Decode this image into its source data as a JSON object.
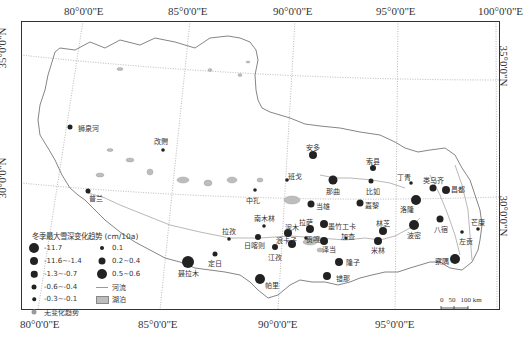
{
  "map": {
    "longitude_ticks_top": [
      "80°0'0\"E",
      "85°0'0\"E",
      "90°0'0\"E",
      "95°0'0\"E",
      "100°0'0\"E"
    ],
    "longitude_ticks_bottom": [
      "80°0'0\"E",
      "85°0'0\"E",
      "90°0'0\"E",
      "95°0'0\"E"
    ],
    "latitude_ticks_left": [
      "35°0'0\"N",
      "30°0'0\"N"
    ],
    "latitude_ticks_right": [
      "35°0'0\"N",
      "30°0'0\"N"
    ],
    "colors": {
      "frame": "#333333",
      "boundary": "#777777",
      "graticule": "#999999",
      "station": "#222222",
      "no_change": "#9a9a9a",
      "lake": "#bdbdbd",
      "river": "#9a9a9a"
    }
  },
  "legend": {
    "title": "冬季最大雪深变化趋势 (cm/10a)",
    "items": [
      {
        "label": "-11.7",
        "size": 10,
        "color": "#222222"
      },
      {
        "label": "-11.6~-1.4",
        "size": 8,
        "color": "#222222"
      },
      {
        "label": "-1.3~-0.7",
        "size": 6.5,
        "color": "#222222"
      },
      {
        "label": "-0.6~-0.4",
        "size": 5,
        "color": "#222222"
      },
      {
        "label": "-0.3~-0.1",
        "size": 3.5,
        "color": "#222222"
      },
      {
        "label": "无变化趋势",
        "size": 5,
        "color": "#9a9a9a"
      },
      {
        "label": "0.1",
        "size": 4,
        "color": "#222222"
      },
      {
        "label": "0.2~0.4",
        "size": 7,
        "color": "#222222"
      },
      {
        "label": "0.5~0.6",
        "size": 10,
        "color": "#222222"
      },
      {
        "label": "河流",
        "type": "line"
      },
      {
        "label": "湖泊",
        "type": "rect"
      }
    ]
  },
  "scale_bar": {
    "labels": [
      "0",
      "50",
      "100 km"
    ]
  },
  "stations": [
    {
      "name": "狮泉河",
      "x": 70,
      "y": 127,
      "r": 2.5,
      "lx": 88,
      "ly": 123
    },
    {
      "name": "普兰",
      "x": 88,
      "y": 191,
      "r": 2.5,
      "lx": 96,
      "ly": 193
    },
    {
      "name": "改则",
      "x": 163,
      "y": 150,
      "r": 1.8,
      "lx": 161,
      "ly": 136
    },
    {
      "name": "中扎",
      "x": 255,
      "y": 190,
      "r": 1.8,
      "lx": 253,
      "ly": 195
    },
    {
      "name": "班戈",
      "x": 287,
      "y": 180,
      "r": 1.8,
      "lx": 295,
      "ly": 171
    },
    {
      "name": "安多",
      "x": 313,
      "y": 155,
      "r": 4,
      "lx": 313,
      "ly": 142
    },
    {
      "name": "索县",
      "x": 373,
      "y": 168,
      "r": 3,
      "lx": 373,
      "ly": 156
    },
    {
      "name": "那曲",
      "x": 333,
      "y": 180,
      "r": 4.5,
      "lx": 333,
      "ly": 186
    },
    {
      "name": "比如",
      "x": 371,
      "y": 181,
      "r": 2.5,
      "lx": 373,
      "ly": 186
    },
    {
      "name": "丁青",
      "x": 411,
      "y": 183,
      "r": 1.8,
      "lx": 404,
      "ly": 172
    },
    {
      "name": "类乌齐",
      "x": 433,
      "y": 188,
      "r": 3.5,
      "lx": 433,
      "ly": 175
    },
    {
      "name": "昌都",
      "x": 446,
      "y": 190,
      "r": 4,
      "lx": 458,
      "ly": 184
    },
    {
      "name": "当雄",
      "x": 311,
      "y": 204,
      "r": 3.5,
      "lx": 323,
      "ly": 201
    },
    {
      "name": "嘉黎",
      "x": 360,
      "y": 203,
      "r": 3.5,
      "lx": 372,
      "ly": 200
    },
    {
      "name": "洛隆",
      "x": 416,
      "y": 200,
      "r": 5,
      "lx": 407,
      "ly": 204
    },
    {
      "name": "南木林",
      "x": 264,
      "y": 226,
      "r": 1.8,
      "lx": 264,
      "ly": 213
    },
    {
      "name": "拉孜",
      "x": 229,
      "y": 239,
      "r": 1.8,
      "lx": 229,
      "ly": 226
    },
    {
      "name": "日喀则",
      "x": 258,
      "y": 237,
      "r": 3,
      "lx": 254,
      "ly": 240
    },
    {
      "name": "泥木",
      "x": 288,
      "y": 233,
      "r": 4,
      "lx": 292,
      "ly": 222
    },
    {
      "name": "拉萨",
      "x": 310,
      "y": 229,
      "r": 4,
      "lx": 306,
      "ly": 217
    },
    {
      "name": "墨竹工卡",
      "x": 324,
      "y": 224,
      "r": 4,
      "lx": 342,
      "ly": 221
    },
    {
      "name": "林芝",
      "x": 383,
      "y": 231,
      "r": 4,
      "lx": 383,
      "ly": 218
    },
    {
      "name": "波密",
      "x": 414,
      "y": 225,
      "r": 5,
      "lx": 414,
      "ly": 230
    },
    {
      "name": "八宿",
      "x": 440,
      "y": 219,
      "r": 3.5,
      "lx": 441,
      "ly": 224
    },
    {
      "name": "芒康",
      "x": 478,
      "y": 229,
      "r": 1.8,
      "lx": 478,
      "ly": 217
    },
    {
      "name": "左贡",
      "x": 462,
      "y": 232,
      "r": 1.8,
      "lx": 466,
      "ly": 236
    },
    {
      "name": "江孜",
      "x": 275,
      "y": 247,
      "r": 3,
      "lx": 275,
      "ly": 252
    },
    {
      "name": "浪卡子",
      "x": 292,
      "y": 244,
      "r": 4,
      "lx": 286,
      "ly": 235
    },
    {
      "name": "贡嘎",
      "x": 306,
      "y": 238,
      "r": 1.8,
      "lx": 313,
      "ly": 234
    },
    {
      "name": "泽当",
      "x": 324,
      "y": 241,
      "r": 4,
      "lx": 329,
      "ly": 244
    },
    {
      "name": "加查",
      "x": 346,
      "y": 238,
      "r": 1.5,
      "lx": 348,
      "ly": 231
    },
    {
      "name": "米林",
      "x": 378,
      "y": 241,
      "r": 4,
      "lx": 378,
      "ly": 245
    },
    {
      "name": "定日",
      "x": 215,
      "y": 254,
      "r": 2.5,
      "lx": 215,
      "ly": 258
    },
    {
      "name": "聂拉木",
      "x": 188,
      "y": 262,
      "r": 6,
      "lx": 188,
      "ly": 268
    },
    {
      "name": "帕里",
      "x": 260,
      "y": 279,
      "r": 5,
      "lx": 272,
      "ly": 280
    },
    {
      "name": "隆子",
      "x": 339,
      "y": 262,
      "r": 4,
      "lx": 353,
      "ly": 257
    },
    {
      "name": "错那",
      "x": 327,
      "y": 276,
      "r": 4,
      "lx": 343,
      "ly": 273
    },
    {
      "name": "察隅",
      "x": 455,
      "y": 259,
      "r": 5,
      "lx": 442,
      "ly": 256
    }
  ]
}
